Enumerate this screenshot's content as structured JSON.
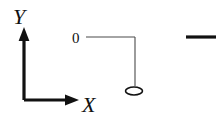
{
  "diagram": {
    "background_color": "#ffffff",
    "stroke_color": "#111111",
    "thin_stroke_color": "#4a4a4a",
    "width": 222,
    "height": 124,
    "axes": {
      "y_axis": {
        "label": "Y",
        "label_x": 13,
        "label_y": 24,
        "font_size": 22,
        "line_x": 24,
        "line_top": 34,
        "line_bottom": 100,
        "stroke_width": 3.2,
        "arrow_tip_y": 27,
        "arrow_half_width": 5.4,
        "arrow_length": 14
      },
      "x_axis": {
        "label": "X",
        "label_x": 82,
        "label_y": 112,
        "font_size": 22,
        "line_y": 100,
        "line_left": 24,
        "line_right": 70,
        "stroke_width": 3.2,
        "arrow_tip_x": 79,
        "arrow_half_width": 5.4,
        "arrow_length": 14
      }
    },
    "value_label": {
      "text": "0",
      "x": 72,
      "y": 43,
      "font_size": 15
    },
    "level_line": {
      "horizontal": {
        "x1": 86,
        "y1": 37,
        "x2": 135,
        "y2": 37
      },
      "vertical": {
        "x1": 135,
        "y1": 37,
        "x2": 135,
        "y2": 86
      },
      "stroke_width": 1.1
    },
    "node_ellipse": {
      "cx": 134,
      "cy": 91,
      "rx": 8.5,
      "ry": 4,
      "stroke_width": 1.6,
      "fill": "none"
    },
    "detached_dash": {
      "x1": 186,
      "y1": 37,
      "x2": 216,
      "y2": 37,
      "stroke_width": 3.2
    }
  }
}
